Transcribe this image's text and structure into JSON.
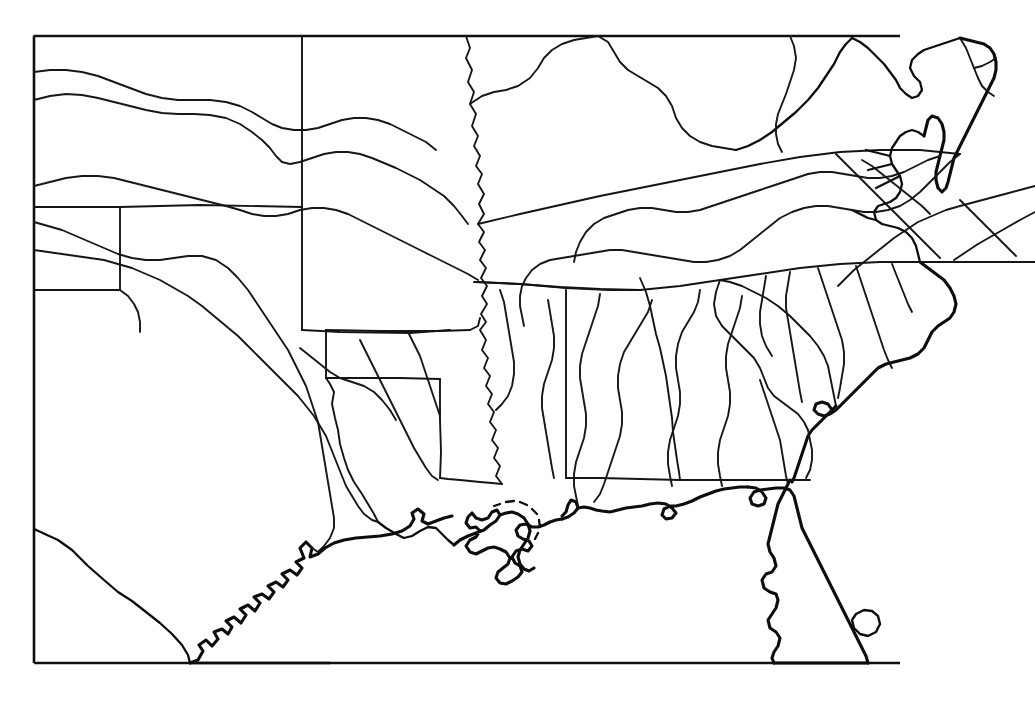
{
  "document": {
    "type": "outline map",
    "region_title": "Southeastern United States",
    "background_color": "#ffffff",
    "line_color": "#101010",
    "caption": "",
    "width": 1035,
    "height": 706
  },
  "frame": {
    "name": "map-neatline",
    "x": 34,
    "y": 36,
    "width": 866,
    "height": 627,
    "stroke": "#101010",
    "note": "rectangular clipping frame; coastline of Florida and Virginia extends beyond the right edge"
  },
  "legend": {
    "feature_classes": [
      {
        "key": "coastline",
        "label": "Coastline",
        "stroke": "#0d0d0d"
      },
      {
        "key": "state-boundary",
        "label": "State boundary",
        "stroke": "#141414"
      },
      {
        "key": "river",
        "label": "River",
        "stroke": "#171717"
      },
      {
        "key": "lake",
        "label": "Lake",
        "stroke": "#0d0d0d"
      }
    ]
  },
  "map_content": {
    "states_depicted": [
      "Texas",
      "Oklahoma",
      "Kansas",
      "Arkansas",
      "Missouri",
      "Louisiana",
      "Mississippi",
      "Alabama",
      "Tennessee",
      "Kentucky",
      "Georgia",
      "Florida",
      "South Carolina",
      "North Carolina",
      "Virginia",
      "Maryland",
      "Delaware"
    ],
    "water_features": [
      "Mississippi River",
      "Red River",
      "Arkansas River",
      "Missouri River",
      "Tennessee River",
      "Ohio River",
      "Rio Grande",
      "Alabama River",
      "Chattahoochee River",
      "Savannah River",
      "Pearl River",
      "Mississippi River Delta",
      "Chesapeake Bay",
      "Lake Okeechobee",
      "Gulf of Mexico",
      "Atlantic Ocean"
    ],
    "landmarks": [
      "Delmarva Peninsula",
      "Florida Peninsula",
      "Texas barrier islands",
      "Outer Banks"
    ]
  }
}
